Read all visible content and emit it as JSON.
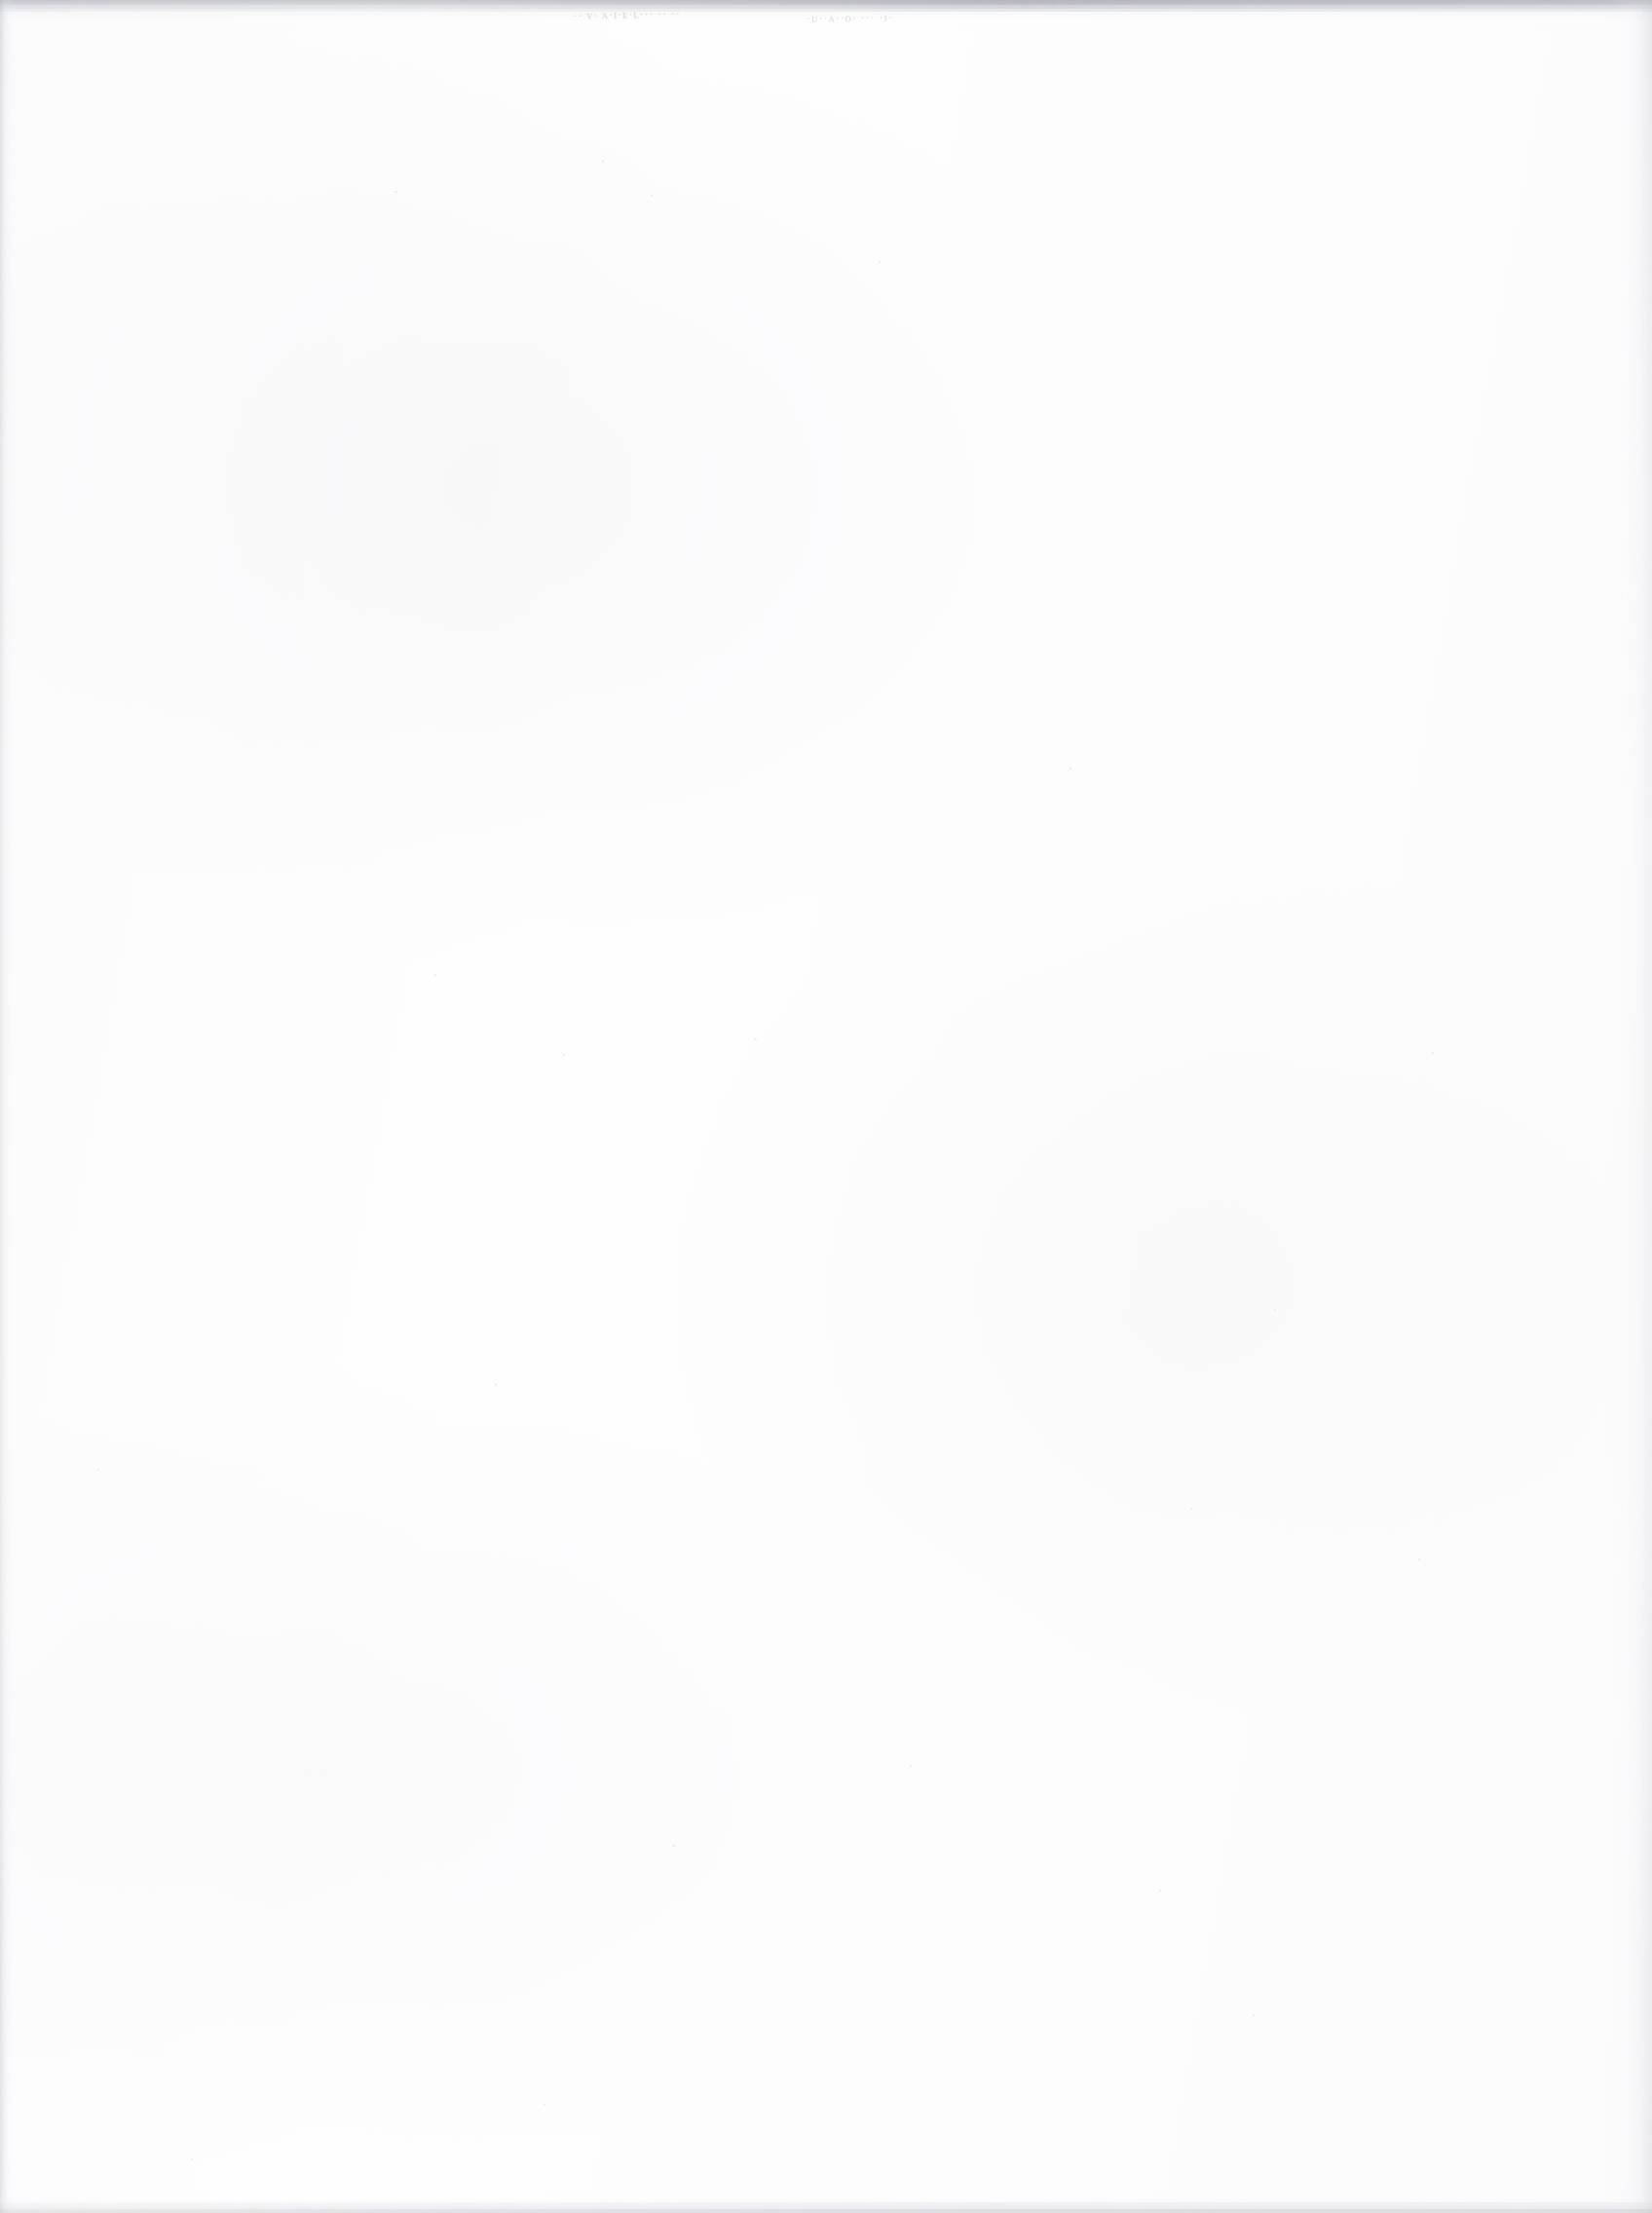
{
  "page": {
    "kind": "scanned-document-page",
    "orientation": "portrait",
    "body_text": "",
    "heading": "",
    "page_number": "",
    "footer_text": ""
  },
  "colors": {
    "paper": "#fdfdfd",
    "paper_tint": "#fbfbfc",
    "edge_shadow": "#b0b2b8",
    "speckle": "#9698a0",
    "ink": "#6d7079",
    "dust": "#d8d9dd"
  },
  "marks": [
    {
      "name": "ink-mark-upper-left",
      "legible": false,
      "transcription": "",
      "placeholder_glyphs": "·· ᴠ· ᴀ·ɪ·ᴇ·ʟ··· ·· ··",
      "x": 588,
      "y": 4,
      "width": 130,
      "height": 26
    },
    {
      "name": "ink-mark-upper-right",
      "legible": false,
      "transcription": "",
      "placeholder_glyphs": "·ᴜ··ᴀ··ᴏ· ··· ·ɪ·",
      "x": 828,
      "y": 6,
      "width": 140,
      "height": 28
    }
  ],
  "edges": {
    "top_shadow": "speckled-gray-band",
    "left_shadow": "vertical-gray-stripe",
    "right_shadow": "vertical-gray-stripe",
    "bottom_shadow": "speckled-gray-line"
  }
}
